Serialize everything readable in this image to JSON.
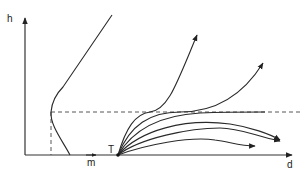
{
  "diagram": {
    "axes": {
      "y_label": "h",
      "x_label": "d"
    },
    "markers": {
      "m_label": "m",
      "t_label": "T"
    },
    "elements": {
      "left_profile_curve": "curve bulging left to the dashed reference height, then rising straight",
      "reference_height": "dashed horizontal line at the profile minimum",
      "reference_vertical": "dashed vertical line dropping to the d-axis",
      "trajectory_fan": "six trajectories emanating from point T"
    },
    "trajectory_count": 6,
    "colors": {
      "line": "#2a2a2a",
      "background": "#ffffff"
    }
  }
}
